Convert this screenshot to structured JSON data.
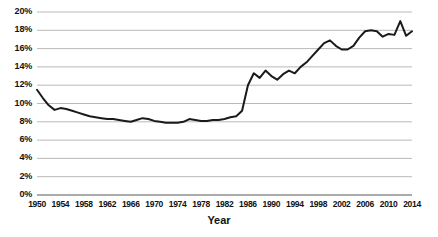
{
  "chart_data": {
    "type": "line",
    "title": "",
    "xlabel": "Year",
    "ylabel": "",
    "xlim": [
      1950,
      2014
    ],
    "ylim": [
      0,
      20
    ],
    "grid": true,
    "legend": false,
    "line_color": "#1a1a1a",
    "grid_color": "#b9b9b9",
    "y_ticks": [
      "0%",
      "2%",
      "4%",
      "6%",
      "8%",
      "10%",
      "12%",
      "14%",
      "16%",
      "18%",
      "20%"
    ],
    "y_tick_values": [
      0,
      2,
      4,
      6,
      8,
      10,
      12,
      14,
      16,
      18,
      20
    ],
    "x_ticks": [
      "1950",
      "1954",
      "1958",
      "1962",
      "1966",
      "1970",
      "1974",
      "1978",
      "1982",
      "1986",
      "1990",
      "1994",
      "1998",
      "2002",
      "2006",
      "2010",
      "2014"
    ],
    "x_tick_values": [
      1950,
      1954,
      1958,
      1962,
      1966,
      1970,
      1974,
      1978,
      1982,
      1986,
      1990,
      1994,
      1998,
      2002,
      2006,
      2010,
      2014
    ],
    "x": [
      1950,
      1951,
      1952,
      1953,
      1954,
      1955,
      1956,
      1957,
      1958,
      1959,
      1960,
      1961,
      1962,
      1963,
      1964,
      1965,
      1966,
      1967,
      1968,
      1969,
      1970,
      1971,
      1972,
      1973,
      1974,
      1975,
      1976,
      1977,
      1978,
      1979,
      1980,
      1981,
      1982,
      1983,
      1984,
      1985,
      1986,
      1987,
      1988,
      1989,
      1990,
      1991,
      1992,
      1993,
      1994,
      1995,
      1996,
      1997,
      1998,
      1999,
      2000,
      2001,
      2002,
      2003,
      2004,
      2005,
      2006,
      2007,
      2008,
      2009,
      2010,
      2011,
      2012,
      2013,
      2014
    ],
    "values": [
      11.5,
      10.6,
      9.8,
      9.3,
      9.5,
      9.4,
      9.2,
      9.0,
      8.8,
      8.6,
      8.5,
      8.4,
      8.3,
      8.3,
      8.2,
      8.1,
      8.0,
      8.2,
      8.4,
      8.3,
      8.1,
      8.0,
      7.9,
      7.9,
      7.9,
      8.0,
      8.3,
      8.2,
      8.1,
      8.1,
      8.2,
      8.2,
      8.3,
      8.5,
      8.6,
      9.2,
      12.0,
      13.3,
      12.8,
      13.6,
      13.0,
      12.6,
      13.2,
      13.6,
      13.3,
      14.0,
      14.5,
      15.2,
      15.9,
      16.6,
      16.9,
      16.3,
      15.9,
      15.9,
      16.3,
      17.2,
      17.9,
      18.0,
      17.9,
      17.3,
      17.6,
      17.5,
      19.0,
      17.4,
      17.9
    ]
  }
}
